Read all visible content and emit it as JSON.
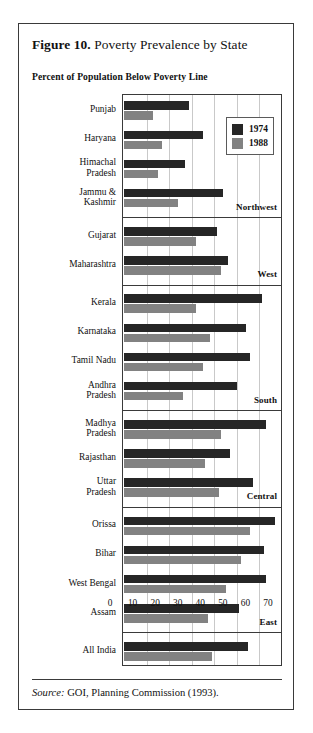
{
  "figure": {
    "number_label": "Figure 10.",
    "title": " Poverty Prevalence by State",
    "subtitle": "Percent of Population Below Poverty Line",
    "source_label": "Source:",
    "source_text": " GOI, Planning Commission (1993)."
  },
  "legend": {
    "position": "top-right-inside-plot",
    "entries": [
      {
        "label": "1974",
        "color": "#262626"
      },
      {
        "label": "1988",
        "color": "#828282"
      }
    ]
  },
  "colors": {
    "series_1974": "#262626",
    "series_1988": "#828282",
    "frame": "#3a3a3a",
    "gridline": "#c9c9c9",
    "background": "#ffffff"
  },
  "chart_data": {
    "type": "bar",
    "orientation": "horizontal",
    "title": "Figure 10. Poverty Prevalence by State",
    "subtitle": "Percent of Population Below Poverty Line",
    "xlabel": "",
    "ylabel": "",
    "xlim": [
      0,
      70
    ],
    "xticks": [
      0,
      10,
      20,
      30,
      40,
      50,
      60,
      70
    ],
    "xtick_labels": [
      "0",
      "10",
      "20",
      "30",
      "40",
      "50",
      "60",
      "70"
    ],
    "grid": "vertical",
    "legend": [
      "1974",
      "1988"
    ],
    "categories": [
      "Punjab",
      "Haryana",
      "Himachal Pradesh",
      "Jammu & Kashmir",
      "Gujarat",
      "Maharashtra",
      "Kerala",
      "Karnataka",
      "Tamil Nadu",
      "Andhra Pradesh",
      "Madhya Pradesh",
      "Rajasthan",
      "Uttar Pradesh",
      "Orissa",
      "Bihar",
      "West Bengal",
      "Assam",
      "All India"
    ],
    "series": [
      {
        "name": "1974",
        "color": "#262626",
        "values": [
          29,
          35,
          27,
          44,
          41,
          46,
          61,
          54,
          56,
          50,
          63,
          47,
          57,
          67,
          62,
          63,
          51,
          55
        ]
      },
      {
        "name": "1988",
        "color": "#828282",
        "values": [
          13,
          17,
          15,
          24,
          32,
          43,
          32,
          38,
          35,
          26,
          43,
          36,
          42,
          56,
          52,
          45,
          37,
          39
        ]
      }
    ],
    "region_groups": [
      {
        "label": "Northwest",
        "categories": [
          "Punjab",
          "Haryana",
          "Himachal Pradesh",
          "Jammu & Kashmir"
        ]
      },
      {
        "label": "West",
        "categories": [
          "Gujarat",
          "Maharashtra"
        ]
      },
      {
        "label": "South",
        "categories": [
          "Kerala",
          "Karnataka",
          "Tamil Nadu",
          "Andhra Pradesh"
        ]
      },
      {
        "label": "Central",
        "categories": [
          "Madhya Pradesh",
          "Rajasthan",
          "Uttar Pradesh"
        ]
      },
      {
        "label": "East",
        "categories": [
          "Orissa",
          "Bihar",
          "West Bengal",
          "Assam"
        ]
      },
      {
        "label": "",
        "categories": [
          "All India"
        ]
      }
    ],
    "category_display": [
      "Punjab",
      "Haryana",
      "Himachal\nPradesh",
      "Jammu &\nKashmir",
      "Gujarat",
      "Maharashtra",
      "Kerala",
      "Karnataka",
      "Tamil Nadu",
      "Andhra\nPradesh",
      "Madhya\nPradesh",
      "Rajasthan",
      "Uttar\nPradesh",
      "Orissa",
      "Bihar",
      "West Bengal",
      "Assam",
      "All India"
    ]
  }
}
